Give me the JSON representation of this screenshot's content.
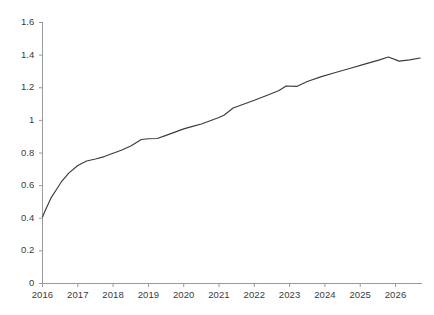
{
  "chart_data": {
    "type": "line",
    "title": "",
    "subtitle": "",
    "xlabel": "",
    "ylabel": "",
    "grid": false,
    "legend": false,
    "legend_position": "none",
    "line_color": "#3c3c3c",
    "axis_color": "#9a9a9a",
    "label_color": "#3a3a3a",
    "xlim": [
      2016.0,
      2026.75
    ],
    "ylim": [
      0,
      1.6
    ],
    "yticks": [
      0,
      0.2,
      0.4,
      0.6,
      0.8,
      1,
      1.2,
      1.4,
      1.6
    ],
    "ytick_labels": [
      "0",
      "0.2",
      "0.4",
      "0.6",
      "0.8",
      "1",
      "1.2",
      "1.4",
      "1.6"
    ],
    "xticks": [
      2016,
      2017,
      2018,
      2019,
      2020,
      2021,
      2022,
      2023,
      2024,
      2025,
      2026
    ],
    "xtick_labels": [
      "2016",
      "2017",
      "2018",
      "2019",
      "2020",
      "2021",
      "2022",
      "2023",
      "2024",
      "2025",
      "2026"
    ],
    "series": [
      {
        "name": "series-1",
        "x": [
          2016.0,
          2016.1,
          2016.25,
          2016.4,
          2016.55,
          2016.75,
          2017.0,
          2017.25,
          2017.5,
          2017.75,
          2018.0,
          2018.25,
          2018.5,
          2018.8,
          2019.0,
          2019.25,
          2019.5,
          2019.75,
          2020.0,
          2020.25,
          2020.5,
          2020.75,
          2021.0,
          2021.15,
          2021.4,
          2021.75,
          2022.0,
          2022.35,
          2022.7,
          2022.9,
          2023.2,
          2023.5,
          2023.9,
          2024.3,
          2024.7,
          2025.1,
          2025.5,
          2025.8,
          2026.1,
          2026.4,
          2026.7
        ],
        "y": [
          0.405,
          0.455,
          0.525,
          0.575,
          0.625,
          0.675,
          0.72,
          0.748,
          0.76,
          0.775,
          0.795,
          0.815,
          0.84,
          0.88,
          0.884,
          0.886,
          0.905,
          0.925,
          0.945,
          0.96,
          0.975,
          0.995,
          1.015,
          1.03,
          1.073,
          1.1,
          1.12,
          1.15,
          1.18,
          1.208,
          1.205,
          1.235,
          1.265,
          1.29,
          1.315,
          1.34,
          1.365,
          1.385,
          1.36,
          1.368,
          1.379
        ]
      }
    ]
  }
}
